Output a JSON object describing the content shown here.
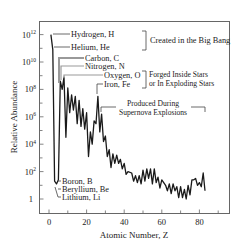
{
  "chart_data": {
    "type": "line",
    "title": "",
    "xlabel": "Atomic Number, Z",
    "ylabel": "Relative Abundance",
    "xlim": [
      -5,
      96
    ],
    "ylim_log10": [
      -1,
      13
    ],
    "yscale": "log",
    "x_ticks": [
      0,
      20,
      40,
      60,
      80
    ],
    "x_minor_ticks": [
      10,
      30,
      50,
      70,
      90
    ],
    "y_ticks": [
      {
        "log10": 12,
        "label": "10",
        "sup": "12"
      },
      {
        "log10": 10,
        "label": "10",
        "sup": "10"
      },
      {
        "log10": 8,
        "label": "10",
        "sup": "8"
      },
      {
        "log10": 6,
        "label": "10",
        "sup": "6"
      },
      {
        "log10": 4,
        "label": "10",
        "sup": "4"
      },
      {
        "log10": 2,
        "label": "10",
        "sup": "2"
      },
      {
        "log10": 0,
        "label": "1",
        "sup": ""
      }
    ],
    "y_minor_ticks_log10": [
      11,
      9,
      7,
      5,
      3,
      1
    ],
    "grid": false,
    "legend": null,
    "series": [
      {
        "name": "Relative Abundance (log10)",
        "x": [
          1,
          2,
          3,
          4,
          5,
          6,
          7,
          8,
          9,
          10,
          11,
          12,
          13,
          14,
          15,
          16,
          17,
          18,
          19,
          20,
          21,
          22,
          23,
          24,
          25,
          26,
          27,
          28,
          29,
          30,
          31,
          32,
          33,
          34,
          35,
          36,
          37,
          38,
          39,
          40,
          41,
          42,
          44,
          45,
          46,
          47,
          48,
          49,
          50,
          51,
          52,
          53,
          54,
          55,
          56,
          57,
          58,
          59,
          60,
          62,
          63,
          64,
          65,
          66,
          67,
          68,
          69,
          70,
          71,
          72,
          73,
          74,
          75,
          76,
          77,
          78,
          79,
          80,
          81,
          82,
          83
        ],
        "values": [
          12.0,
          10.9,
          1.3,
          1.1,
          1.4,
          8.6,
          8.0,
          8.9,
          4.5,
          8.1,
          6.3,
          7.6,
          6.5,
          7.5,
          5.5,
          7.2,
          5.3,
          6.6,
          5.1,
          6.3,
          3.1,
          4.9,
          4.0,
          5.7,
          5.5,
          7.5,
          4.9,
          6.2,
          4.2,
          4.6,
          3.1,
          3.6,
          2.3,
          3.3,
          2.6,
          3.2,
          2.6,
          2.9,
          2.2,
          2.6,
          1.8,
          2.0,
          1.9,
          1.3,
          1.7,
          1.2,
          1.7,
          1.1,
          2.1,
          1.3,
          2.2,
          1.5,
          2.2,
          1.1,
          2.2,
          1.2,
          1.6,
          0.8,
          1.4,
          1.0,
          0.6,
          1.1,
          0.4,
          1.1,
          0.6,
          0.9,
          0.1,
          0.9,
          0.1,
          0.7,
          0.0,
          1.0,
          0.3,
          1.4,
          1.4,
          1.5,
          1.0,
          1.2,
          0.9,
          1.9,
          0.6
        ]
      }
    ],
    "annotations": [
      {
        "id": "hydrogen",
        "text": "Hydrogen, H",
        "z": 1
      },
      {
        "id": "helium",
        "text": "Helium, He",
        "z": 2
      },
      {
        "id": "carbon",
        "text": "Carbon, C",
        "z": 6
      },
      {
        "id": "nitrogen",
        "text": "Nitrogen, N",
        "z": 7
      },
      {
        "id": "oxygen",
        "text": "Oxygen, O",
        "z": 8
      },
      {
        "id": "iron",
        "text": "Iron, Fe",
        "z": 26
      },
      {
        "id": "boron",
        "text": "Boron, B",
        "z": 5
      },
      {
        "id": "beryllium",
        "text": "Beryllium, Be",
        "z": 4
      },
      {
        "id": "lithium",
        "text": "Lithium, Li",
        "z": 3
      },
      {
        "id": "big-bang",
        "text": "Created in the Big Bang",
        "groups": [
          "hydrogen",
          "helium"
        ]
      },
      {
        "id": "forged",
        "text": [
          "Forged Inside Stars",
          "or In Exploding Stars"
        ],
        "groups": [
          "oxygen",
          "iron"
        ]
      },
      {
        "id": "supernova",
        "text": [
          "Produced During",
          "Supernova Explosions"
        ],
        "range_z": [
          27,
          83
        ]
      }
    ]
  },
  "labels": {
    "hydrogen": "Hydrogen, H",
    "helium": "Helium, He",
    "carbon": "Carbon, C",
    "nitrogen": "Nitrogen, N",
    "oxygen": "Oxygen, O",
    "iron": "Iron, Fe",
    "boron": "Boron, B",
    "beryllium": "Beryllium, Be",
    "lithium": "Lithium, Li",
    "big_bang": "Created in the Big Bang",
    "forged_1": "Forged Inside Stars",
    "forged_2": "or In Exploding Stars",
    "supernova_1": "Produced During",
    "supernova_2": "Supernova Explosions",
    "xlabel": "Atomic Number, Z",
    "ylabel": "Relative Abundance"
  },
  "colors": {
    "line": "#1a1a1a",
    "axis": "#555555",
    "text": "#222222",
    "leader": "#444444"
  }
}
